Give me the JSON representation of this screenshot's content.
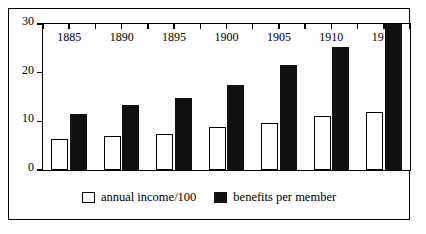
{
  "chart_data": {
    "type": "bar",
    "title": "",
    "xlabel": "",
    "ylabel": "",
    "categories": [
      "1885",
      "1890",
      "1895",
      "1900",
      "1905",
      "1910",
      "1913"
    ],
    "series": [
      {
        "name": "annual income/100",
        "color": "#ffffff",
        "style": "outlined",
        "values": [
          6.3,
          7.0,
          7.5,
          8.8,
          9.6,
          11.0,
          12.0
        ]
      },
      {
        "name": "benefits per member",
        "color": "#111111",
        "style": "filled",
        "values": [
          11.6,
          13.4,
          14.7,
          17.5,
          21.5,
          25.3,
          30.0
        ]
      }
    ],
    "ylim": [
      0,
      30
    ],
    "yticks": [
      0,
      10,
      20,
      30
    ],
    "ytick_labels": [
      "0",
      "10",
      "20",
      "30"
    ],
    "grid": false,
    "legend_position": "bottom"
  },
  "legend": {
    "items": [
      {
        "label": "annual income/100",
        "swatch": "light"
      },
      {
        "label": "benefits per member",
        "swatch": "dark"
      }
    ]
  }
}
